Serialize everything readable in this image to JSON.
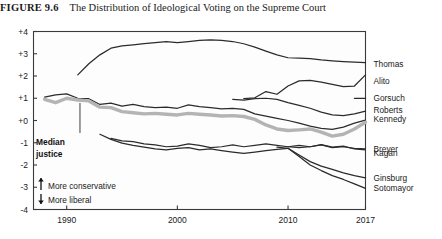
{
  "figure": {
    "number_label": "FIGURE 9.6",
    "title": "The Distribution of Ideological Voting on the Supreme Court"
  },
  "annotations": {
    "median_line1": "Median",
    "median_line2": "justice",
    "more_conservative": "More conservative",
    "more_liberal": "More liberal",
    "up_arrow_icon": "arrow-up-icon",
    "down_arrow_icon": "arrow-down-icon"
  },
  "chart_data": {
    "type": "line",
    "title": "The Distribution of Ideological Voting on the Supreme Court",
    "xlabel": "",
    "ylabel": "",
    "xlim": [
      1987,
      2017
    ],
    "ylim": [
      -4,
      4
    ],
    "grid": false,
    "legend_position": "right-inline-labels",
    "xticks": [
      "1990",
      "2000",
      "2010",
      "2017"
    ],
    "xtick_values": [
      1990,
      2000,
      2010,
      2017
    ],
    "yticks": [
      "+4",
      "+3",
      "+2",
      "+1",
      "+0",
      "-1",
      "-2",
      "-3",
      "-4"
    ],
    "ytick_values": [
      4,
      3,
      2,
      1,
      0,
      -1,
      -2,
      -3,
      -4
    ],
    "series": [
      {
        "name": "Thomas",
        "label_y": 2.55,
        "x": [
          1991,
          1992,
          1993,
          1994,
          1995,
          1996,
          1997,
          1998,
          1999,
          2000,
          2001,
          2002,
          2003,
          2004,
          2005,
          2006,
          2007,
          2008,
          2009,
          2010,
          2011,
          2012,
          2013,
          2014,
          2015,
          2016,
          2017
        ],
        "values": [
          2.05,
          2.55,
          2.95,
          3.25,
          3.35,
          3.4,
          3.45,
          3.5,
          3.55,
          3.5,
          3.55,
          3.6,
          3.62,
          3.6,
          3.55,
          3.45,
          3.3,
          3.12,
          2.95,
          2.82,
          2.8,
          2.78,
          2.72,
          2.68,
          2.65,
          2.62,
          2.6
        ]
      },
      {
        "name": "Alito",
        "label_y": 1.78,
        "x": [
          2006,
          2007,
          2008,
          2009,
          2010,
          2011,
          2012,
          2013,
          2014,
          2015,
          2016,
          2017
        ],
        "values": [
          0.98,
          1.02,
          1.3,
          1.18,
          1.55,
          1.78,
          1.8,
          1.72,
          1.62,
          1.52,
          1.55,
          2.05
        ]
      },
      {
        "name": "Gorsuch",
        "label_y": 1.0,
        "x": [
          2016,
          2017
        ],
        "values": [
          1.0,
          1.0
        ]
      },
      {
        "name": "Roberts",
        "label_y": 0.45,
        "x": [
          2005,
          2006,
          2007,
          2008,
          2009,
          2010,
          2011,
          2012,
          2013,
          2014,
          2015,
          2016,
          2017
        ],
        "values": [
          0.95,
          0.92,
          0.98,
          1.0,
          0.95,
          0.8,
          0.68,
          0.55,
          0.38,
          0.25,
          0.22,
          0.3,
          0.42
        ]
      },
      {
        "name": "Kennedy",
        "label_y": 0.05,
        "x": [
          1988,
          1989,
          1990,
          1991,
          1992,
          1993,
          1994,
          1995,
          1996,
          1997,
          1998,
          1999,
          2000,
          2001,
          2002,
          2003,
          2004,
          2005,
          2006,
          2007,
          2008,
          2009,
          2010,
          2011,
          2012,
          2013,
          2014,
          2015,
          2016,
          2017
        ],
        "values": [
          1.05,
          1.15,
          1.2,
          1.0,
          0.98,
          0.72,
          0.78,
          0.65,
          0.72,
          0.62,
          0.58,
          0.6,
          0.55,
          0.7,
          0.62,
          0.58,
          0.52,
          0.55,
          0.5,
          0.3,
          0.2,
          0.1,
          0.0,
          -0.12,
          -0.25,
          -0.35,
          -0.4,
          -0.3,
          -0.12,
          0.02
        ]
      },
      {
        "name": "Median justice",
        "is_median": true,
        "label_y": null,
        "x": [
          1988,
          1989,
          1990,
          1991,
          1992,
          1993,
          1994,
          1995,
          1996,
          1997,
          1998,
          1999,
          2000,
          2001,
          2002,
          2003,
          2004,
          2005,
          2006,
          2007,
          2008,
          2009,
          2010,
          2011,
          2012,
          2013,
          2014,
          2015,
          2016,
          2017
        ],
        "values": [
          0.95,
          0.8,
          1.0,
          0.92,
          0.88,
          0.6,
          0.58,
          0.4,
          0.35,
          0.3,
          0.32,
          0.28,
          0.25,
          0.32,
          0.28,
          0.25,
          0.2,
          0.22,
          0.18,
          0.05,
          -0.2,
          -0.38,
          -0.45,
          -0.42,
          -0.38,
          -0.52,
          -0.7,
          -0.62,
          -0.38,
          -0.08
        ]
      },
      {
        "name": "Breyer",
        "label_y": -1.3,
        "x": [
          1994,
          1995,
          1996,
          1997,
          1998,
          1999,
          2000,
          2001,
          2002,
          2003,
          2004,
          2005,
          2006,
          2007,
          2008,
          2009,
          2010,
          2011,
          2012,
          2013,
          2014,
          2015,
          2016,
          2017
        ],
        "values": [
          -0.8,
          -0.92,
          -0.95,
          -1.05,
          -1.1,
          -1.18,
          -1.15,
          -1.05,
          -1.12,
          -1.22,
          -1.18,
          -1.1,
          -1.18,
          -1.12,
          -1.05,
          -1.12,
          -1.18,
          -1.22,
          -1.18,
          -1.1,
          -1.22,
          -1.18,
          -1.25,
          -1.28
        ]
      },
      {
        "name": "Kagan",
        "label_y": -1.45,
        "x": [
          2010,
          2011,
          2012,
          2013,
          2014,
          2015,
          2016,
          2017
        ],
        "values": [
          -1.18,
          -1.12,
          -1.18,
          -1.08,
          -1.2,
          -1.15,
          -1.28,
          -1.32
        ]
      },
      {
        "name": "Ginsburg",
        "label_y": -2.6,
        "x": [
          1993,
          1994,
          1995,
          1996,
          1997,
          1998,
          1999,
          2000,
          2001,
          2002,
          2003,
          2004,
          2005,
          2006,
          2007,
          2008,
          2009,
          2010,
          2011,
          2012,
          2013,
          2014,
          2015,
          2016,
          2017
        ],
        "values": [
          -0.62,
          -0.85,
          -1.02,
          -1.12,
          -1.2,
          -1.28,
          -1.32,
          -1.25,
          -1.22,
          -1.32,
          -1.28,
          -1.35,
          -1.42,
          -1.48,
          -1.42,
          -1.35,
          -1.3,
          -1.25,
          -1.55,
          -1.85,
          -2.05,
          -2.2,
          -2.35,
          -2.48,
          -2.58
        ]
      },
      {
        "name": "Sotomayor",
        "label_y": -3.05,
        "x": [
          2009,
          2010,
          2011,
          2012,
          2013,
          2014,
          2015,
          2016,
          2017
        ],
        "values": [
          -1.2,
          -1.25,
          -1.62,
          -2.0,
          -2.25,
          -2.48,
          -2.65,
          -2.85,
          -3.05
        ]
      }
    ]
  }
}
